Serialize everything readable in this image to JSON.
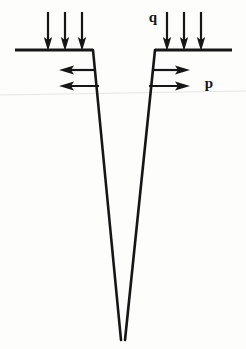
{
  "figure": {
    "title": "",
    "background_color": "#fdfdfc",
    "stroke_color": "#161616",
    "labels": {
      "surcharge_load": "q",
      "lateral_pressure": "p"
    },
    "annotations": [
      {
        "name": "surcharge-load-label",
        "text": "q",
        "x": 153,
        "y": 22,
        "describes": "vertical downward distributed load on right ground surface"
      },
      {
        "name": "lateral-pressure-label",
        "text": "p",
        "x": 209,
        "y": 88,
        "describes": "horizontal outward pressure on right wedge wall"
      }
    ],
    "ground_lines": [
      {
        "name": "ground-line-left",
        "x1": 15,
        "y1": 50,
        "x2": 93,
        "y2": 50
      },
      {
        "name": "ground-line-right",
        "x1": 155,
        "y1": 50,
        "x2": 232,
        "y2": 50
      }
    ],
    "wedge": {
      "name": "v-wedge",
      "apex_x": 123,
      "apex_y": 340,
      "left_wall": {
        "x1": 93,
        "y1": 50,
        "x2": 121,
        "y2": 340
      },
      "right_wall": {
        "x1": 155,
        "y1": 50,
        "x2": 125,
        "y2": 340
      }
    },
    "vertical_arrows": {
      "name": "downward-load-arrows",
      "direction": "down",
      "tail_y": 12,
      "head_y": 50,
      "left_group_x": [
        48,
        65,
        82
      ],
      "right_group_x": [
        167,
        184,
        201
      ]
    },
    "horizontal_arrows": {
      "left_group": {
        "name": "leftward-pressure-arrows",
        "direction": "left",
        "rows": [
          {
            "tail_x": 96,
            "head_x": 60,
            "y": 70
          },
          {
            "tail_x": 99,
            "head_x": 60,
            "y": 86
          }
        ]
      },
      "right_group": {
        "name": "rightward-pressure-arrows",
        "direction": "right",
        "rows": [
          {
            "tail_x": 152,
            "head_x": 190,
            "y": 70
          },
          {
            "tail_x": 149,
            "head_x": 190,
            "y": 86
          }
        ]
      }
    },
    "scan_artifact": {
      "name": "scan-artifact-line",
      "color": "#e3e3e1",
      "x1": 0,
      "y1": 95,
      "x2": 246,
      "y2": 91
    }
  }
}
